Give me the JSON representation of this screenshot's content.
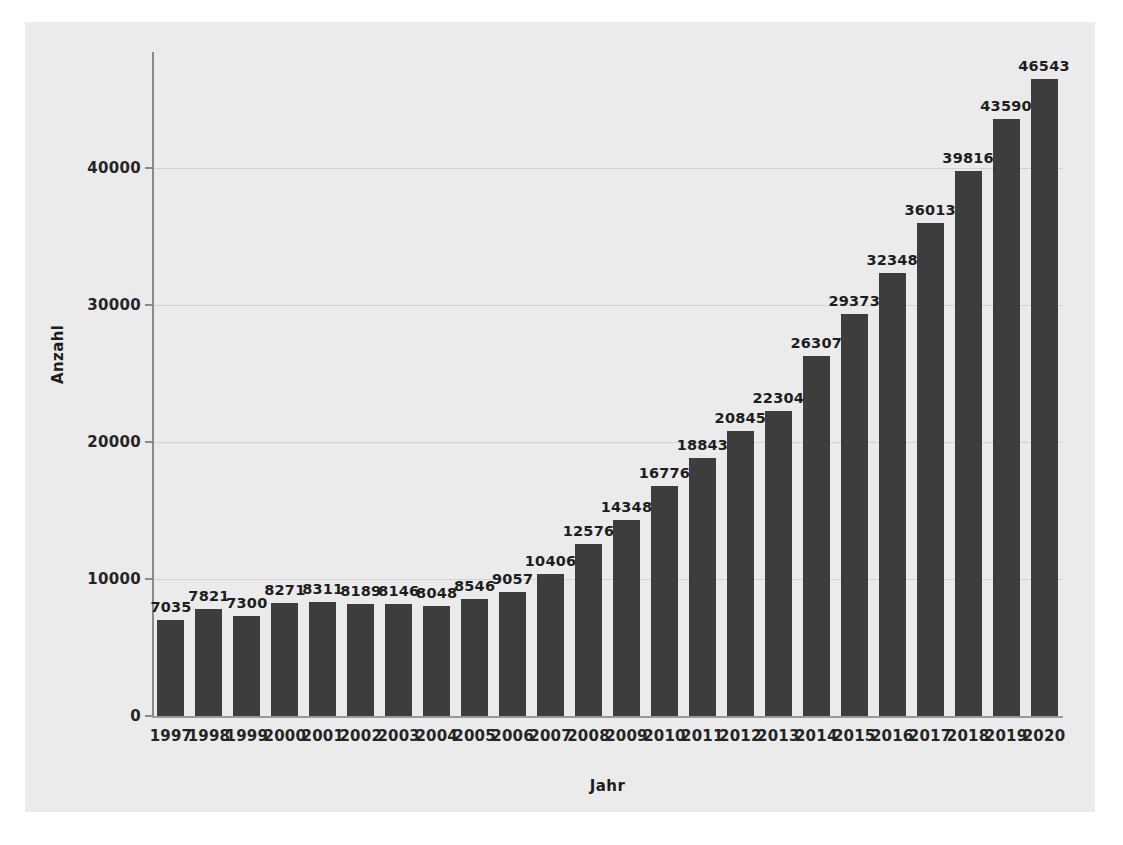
{
  "chart_data": {
    "type": "bar",
    "title": "",
    "xlabel": "Jahr",
    "ylabel": "Anzahl",
    "categories": [
      "1997",
      "1998",
      "1999",
      "2000",
      "2001",
      "2002",
      "2003",
      "2004",
      "2005",
      "2006",
      "2007",
      "2008",
      "2009",
      "2010",
      "2011",
      "2012",
      "2013",
      "2014",
      "2015",
      "2016",
      "2017",
      "2018",
      "2019",
      "2020"
    ],
    "values": [
      7035,
      7821,
      7300,
      8271,
      8311,
      8189,
      8146,
      8048,
      8546,
      9057,
      10406,
      12576,
      14348,
      16776,
      18843,
      20845,
      22304,
      26307,
      29373,
      32348,
      36013,
      39816,
      43590,
      46543
    ],
    "value_labels": [
      "7035",
      "7821",
      "7300",
      "8271",
      "8311",
      "8189",
      "8146",
      "8048",
      "8546",
      "9057",
      "10406",
      "12576",
      "14348",
      "16776",
      "18843",
      "20845",
      "22304",
      "26307",
      "29373",
      "32348",
      "36013",
      "39816",
      "43590",
      "46543"
    ],
    "yticks": [
      0,
      10000,
      20000,
      30000,
      40000
    ],
    "ytick_labels": [
      "0",
      "10000",
      "20000",
      "30000",
      "40000"
    ],
    "ylim": [
      0,
      48500
    ],
    "grid": true,
    "legend": "none",
    "bar_color": "#3d3d3d",
    "background_color": "#ebebeb",
    "grid_color": "#d3d3d3",
    "axis_color": "#8a8a8a"
  }
}
